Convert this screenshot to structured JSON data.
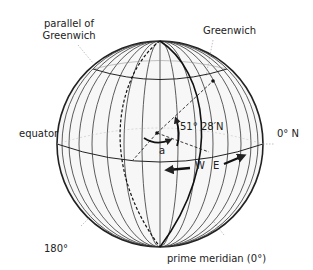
{
  "diagram": {
    "type": "globe-latitude-longitude",
    "labels": {
      "parallel_of_greenwich_line1": "parallel of",
      "parallel_of_greenwich_line2": "Greenwich",
      "greenwich": "Greenwich",
      "latitude": "51° 28′N",
      "angle_a": "a",
      "equator": "equator",
      "zero_n": "0° N",
      "west": "W",
      "east": "E",
      "meridian_180": "180°",
      "prime_meridian": "prime meridian (0°)"
    },
    "colors": {
      "line": "#222222",
      "globe_fill": "#f6f6f6",
      "leader": "#888888"
    }
  }
}
